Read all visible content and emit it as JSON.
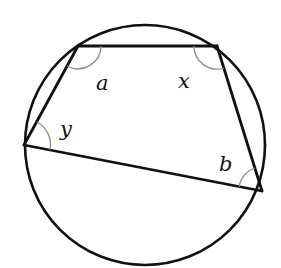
{
  "diagram": {
    "type": "cyclic-quadrilateral",
    "circle": {
      "cx": 145,
      "cy": 145,
      "r": 120
    },
    "vertices": {
      "top_left": {
        "x": 78,
        "y": 46
      },
      "top_right": {
        "x": 217,
        "y": 46
      },
      "left": {
        "x": 24,
        "y": 145
      },
      "bottom_right": {
        "x": 262,
        "y": 191
      }
    },
    "angles": [
      {
        "label": "a",
        "vertex": "top_left",
        "label_x": 96,
        "label_y": 90
      },
      {
        "label": "x",
        "vertex": "top_right",
        "label_x": 178,
        "label_y": 88
      },
      {
        "label": "y",
        "vertex": "left",
        "label_x": 60,
        "label_y": 136
      },
      {
        "label": "b",
        "vertex": "bottom_right",
        "label_x": 219,
        "label_y": 171
      }
    ],
    "colors": {
      "line": "#111111",
      "arc": "#8a8a8a",
      "background": "#ffffff"
    }
  }
}
